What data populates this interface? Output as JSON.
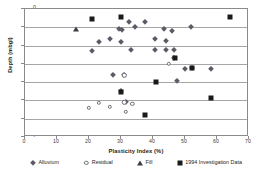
{
  "chart_data": {
    "type": "scatter",
    "title": "",
    "xlabel": "Plasticity Index (%)",
    "ylabel": "Depth (mbgl)",
    "xlim": [
      0,
      70
    ],
    "ylim": [
      -7,
      0
    ],
    "xticks": [
      0,
      10,
      20,
      30,
      40,
      50,
      60,
      70
    ],
    "yticks": [
      0,
      -1,
      -2,
      -3,
      -4,
      -5,
      -6,
      -7
    ],
    "grid": "horizontal",
    "legend_position": "bottom",
    "series": [
      {
        "name": "Alluvium",
        "marker": "diamond",
        "color": "#5b5b66",
        "points": [
          [
            32.5,
            -0.73
          ],
          [
            37.5,
            -0.73
          ],
          [
            29.5,
            -1.12
          ],
          [
            30.2,
            -1.15
          ],
          [
            34.5,
            -1.0
          ],
          [
            43.5,
            -1.1
          ],
          [
            52.0,
            -1.0
          ],
          [
            46.0,
            -1.2
          ],
          [
            26.5,
            -1.62
          ],
          [
            23.0,
            -1.78
          ],
          [
            30.0,
            -1.8
          ],
          [
            40.5,
            -1.65
          ],
          [
            44.0,
            -1.75
          ],
          [
            21.0,
            -2.3
          ],
          [
            33.0,
            -2.22
          ],
          [
            40.5,
            -2.25
          ],
          [
            44.0,
            -2.22
          ],
          [
            46.5,
            -2.25
          ],
          [
            46.6,
            -2.68
          ],
          [
            50.0,
            -3.3
          ],
          [
            52.3,
            -3.25
          ],
          [
            58.0,
            -3.28
          ],
          [
            27.5,
            -3.63
          ],
          [
            31.0,
            -3.62
          ],
          [
            47.5,
            -3.93
          ],
          [
            30.0,
            -4.5
          ],
          [
            31.5,
            -5.1
          ]
        ]
      },
      {
        "name": "Residual",
        "marker": "circle",
        "color": "#6e6e78",
        "points": [
          [
            31.0,
            -3.62
          ],
          [
            23.0,
            -5.12
          ],
          [
            20.0,
            -5.4
          ],
          [
            26.5,
            -5.35
          ],
          [
            31.0,
            -5.1
          ],
          [
            33.5,
            -5.2
          ],
          [
            31.5,
            -5.62
          ],
          [
            45.0,
            -3.0
          ]
        ]
      },
      {
        "name": "Fill",
        "marker": "triangle",
        "color": "#3d3d45",
        "points": [
          [
            16.0,
            -1.1
          ]
        ]
      },
      {
        "name": "1994 Investigation Data",
        "marker": "square",
        "color": "#1a1a1a",
        "points": [
          [
            21.0,
            -0.53
          ],
          [
            30.0,
            -0.42
          ],
          [
            64.0,
            -0.45
          ],
          [
            47.0,
            -2.68
          ],
          [
            52.3,
            -3.22
          ],
          [
            41.0,
            -3.97
          ],
          [
            30.0,
            -4.52
          ],
          [
            58.0,
            -4.85
          ],
          [
            37.5,
            -5.82
          ]
        ]
      }
    ]
  }
}
